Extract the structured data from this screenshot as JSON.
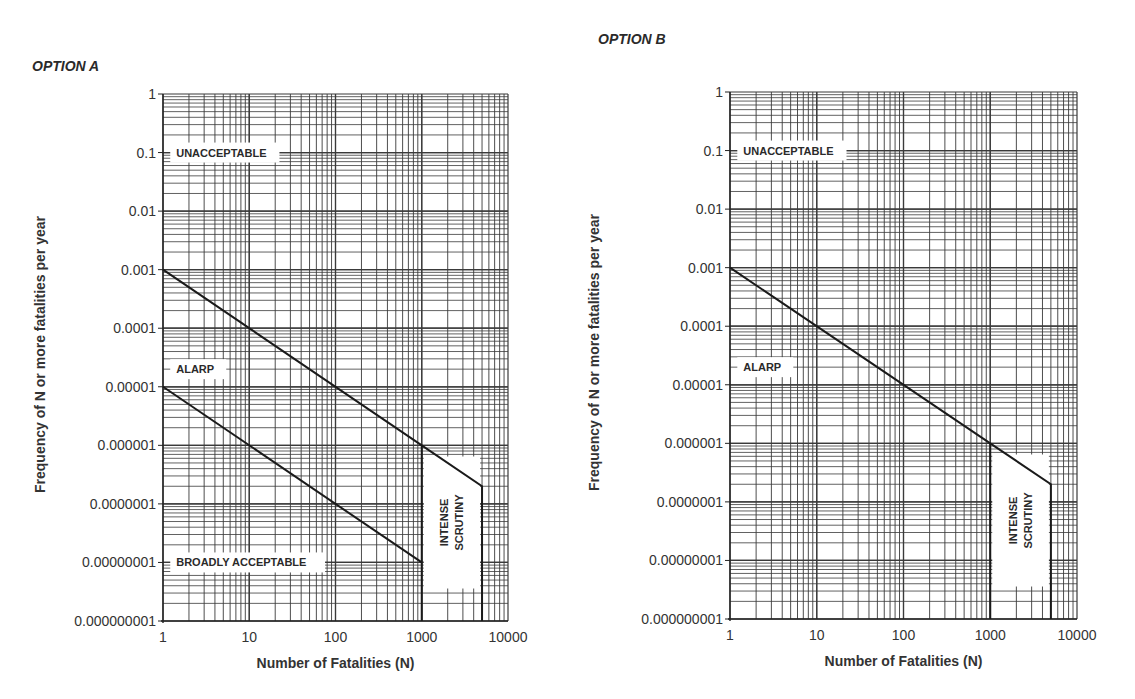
{
  "panels": [
    {
      "title": "OPTION A",
      "title_pos": [
        32,
        69
      ]
    },
    {
      "title": "OPTION B",
      "title_pos": [
        598,
        42
      ]
    }
  ],
  "chart_data": [
    {
      "type": "line",
      "title": "OPTION A",
      "xlabel": "Number of Fatalities (N)",
      "ylabel": "Frequency of N or more fatalities per year",
      "xscale": "log",
      "yscale": "log",
      "xlim": [
        1,
        10000
      ],
      "ylim": [
        1e-09,
        1
      ],
      "x_ticks": [
        "1",
        "10",
        "100",
        "1000",
        "10000"
      ],
      "y_ticks": [
        "1",
        "0.1",
        "0.01",
        "0.001",
        "0.0001",
        "0.00001",
        "0.000001",
        "0.0000001",
        "0.00000001",
        "0.000000001"
      ],
      "grid": true,
      "series": [
        {
          "name": "Upper limit (Unacceptable / ALARP)",
          "x": [
            1,
            1000,
            5000,
            5000
          ],
          "y": [
            0.001,
            1e-06,
            2e-07,
            1e-09
          ]
        },
        {
          "name": "Lower limit (ALARP / Broadly acceptable)",
          "x": [
            1,
            1000
          ],
          "y": [
            1e-05,
            1e-08
          ]
        },
        {
          "name": "Intense scrutiny boundary",
          "x": [
            1000,
            1000
          ],
          "y": [
            1e-06,
            1e-09
          ]
        }
      ],
      "annotations": [
        {
          "text": "UNACCEPTABLE",
          "x": 1.35,
          "y": 0.1
        },
        {
          "text": "ALARP",
          "x": 1.35,
          "y": 2e-05
        },
        {
          "text": "BROADLY ACCEPTABLE",
          "x": 1.35,
          "y": 1e-08
        },
        {
          "text": "INTENSE SCRUTINY",
          "x": 2200,
          "y": 3e-08,
          "rotated": true
        }
      ]
    },
    {
      "type": "line",
      "title": "OPTION B",
      "xlabel": "Number of Fatalities (N)",
      "ylabel": "Frequency of N or more fatalities per year",
      "xscale": "log",
      "yscale": "log",
      "xlim": [
        1,
        10000
      ],
      "ylim": [
        1e-09,
        1
      ],
      "x_ticks": [
        "1",
        "10",
        "100",
        "1000",
        "10000"
      ],
      "y_ticks": [
        "1",
        "0.1",
        "0.01",
        "0.001",
        "0.0001",
        "0.00001",
        "0.000001",
        "0.0000001",
        "0.00000001",
        "0.000000001"
      ],
      "grid": true,
      "series": [
        {
          "name": "Upper limit (Unacceptable / ALARP)",
          "x": [
            1,
            1000,
            5000,
            5000
          ],
          "y": [
            0.001,
            1e-06,
            2e-07,
            1e-09
          ]
        },
        {
          "name": "Intense scrutiny boundary",
          "x": [
            1000,
            1000
          ],
          "y": [
            1e-06,
            1e-09
          ]
        }
      ],
      "annotations": [
        {
          "text": "UNACCEPTABLE",
          "x": 1.35,
          "y": 0.1
        },
        {
          "text": "ALARP",
          "x": 1.35,
          "y": 2e-05
        },
        {
          "text": "INTENSE SCRUTINY",
          "x": 2200,
          "y": 3e-08,
          "rotated": true
        }
      ]
    }
  ],
  "layout": [
    {
      "left": 163,
      "right": 508,
      "top": 94,
      "bottom": 621,
      "ylabel_x": 45,
      "xlabel_y": 668
    },
    {
      "left": 730,
      "right": 1077,
      "top": 92,
      "bottom": 619,
      "ylabel_x": 599,
      "xlabel_y": 666
    }
  ],
  "colors": {
    "grid": "#3a3a3a",
    "line": "#1a1a1a",
    "text": "#333333"
  }
}
